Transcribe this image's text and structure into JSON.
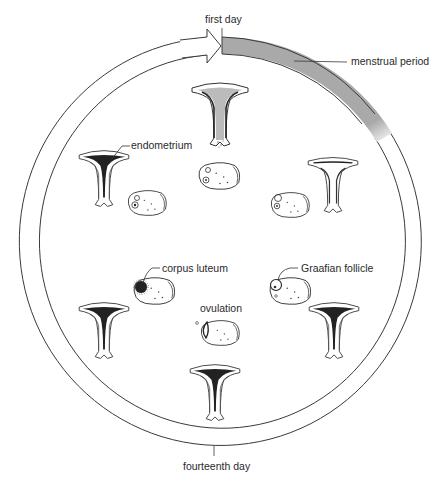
{
  "diagram": {
    "type": "menstrual-cycle-diagram",
    "colors": {
      "line": "#3a3a3a",
      "menstrual_band": "#a9a9a9",
      "background": "#ffffff",
      "text": "#2a2a2a"
    },
    "labels": {
      "first_day": "first day",
      "menstrual_period": "menstrual period",
      "endometrium": "endometrium",
      "corpus_luteum": "corpus luteum",
      "graafian_follicle": "Graafian follicle",
      "ovulation": "ovulation",
      "fourteenth_day": "fourteenth day"
    },
    "stages": [
      {
        "position": "top",
        "uterus": "shedding-lining",
        "ovary": "small-follicles"
      },
      {
        "position": "upper-right",
        "uterus": "thin-lining",
        "ovary": "developing-follicle"
      },
      {
        "position": "lower-right",
        "uterus": "thickening-lining",
        "ovary": "graafian-follicle"
      },
      {
        "position": "bottom",
        "uterus": "thick-lining",
        "ovary": "ovulation"
      },
      {
        "position": "lower-left",
        "uterus": "thick-lining",
        "ovary": "corpus-luteum"
      },
      {
        "position": "upper-left",
        "uterus": "thick-endometrium",
        "ovary": "degenerating-corpus-luteum"
      }
    ]
  }
}
